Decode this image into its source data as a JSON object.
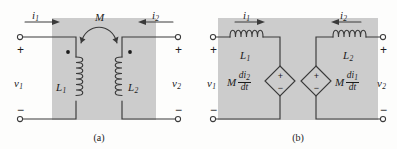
{
  "figure": {
    "panels": [
      {
        "id": "a",
        "caption": "(a)",
        "background_color": "#cccccc",
        "currents": [
          {
            "name": "i1",
            "symbol": "i",
            "subscript": "1",
            "direction": "right"
          },
          {
            "name": "i2",
            "symbol": "i",
            "subscript": "2",
            "direction": "left"
          }
        ],
        "mutual": {
          "label": "M",
          "arc": "double-headed"
        },
        "inductors": [
          {
            "name": "L1",
            "symbol": "L",
            "subscript": "1",
            "orientation": "vertical",
            "dot": "top-left"
          },
          {
            "name": "L2",
            "symbol": "L",
            "subscript": "2",
            "orientation": "vertical",
            "dot": "top-left"
          }
        ],
        "voltages": [
          {
            "name": "v1",
            "symbol": "v",
            "subscript": "1",
            "plus": "+",
            "minus": "−"
          },
          {
            "name": "v2",
            "symbol": "v",
            "subscript": "2",
            "plus": "+",
            "minus": "−"
          }
        ]
      },
      {
        "id": "b",
        "caption": "(b)",
        "background_color": "#cccccc",
        "currents": [
          {
            "name": "i1",
            "symbol": "i",
            "subscript": "1",
            "direction": "right"
          },
          {
            "name": "i2",
            "symbol": "i",
            "subscript": "2",
            "direction": "left"
          }
        ],
        "inductors": [
          {
            "name": "L1",
            "symbol": "L",
            "subscript": "1",
            "orientation": "horizontal"
          },
          {
            "name": "L2",
            "symbol": "L",
            "subscript": "2",
            "orientation": "horizontal"
          }
        ],
        "sources": [
          {
            "name": "source-left",
            "coefficient": "M",
            "numerator": "di",
            "numerator_subscript": "2",
            "denominator": "dt",
            "plus": "+",
            "minus": "−",
            "label_side": "left"
          },
          {
            "name": "source-right",
            "coefficient": "M",
            "numerator": "di",
            "numerator_subscript": "1",
            "denominator": "dt",
            "plus": "+",
            "minus": "−",
            "label_side": "right"
          }
        ],
        "voltages": [
          {
            "name": "v1",
            "symbol": "v",
            "subscript": "1",
            "plus": "+",
            "minus": "−"
          },
          {
            "name": "v2",
            "symbol": "v",
            "subscript": "2",
            "plus": "+",
            "minus": "−"
          }
        ]
      }
    ],
    "colors": {
      "wire": "#3a3a3a",
      "text": "#1c1c1c",
      "panel_fill": "#cccccc",
      "page": "#fdfdfc"
    }
  }
}
